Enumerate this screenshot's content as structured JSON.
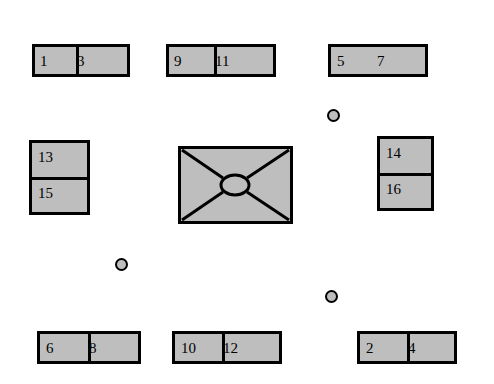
{
  "diagram": {
    "background_color": "#ffffff",
    "node_fill_color": "#bebebe",
    "node_border_color": "#000000",
    "nodes": [
      {
        "id": "node-top-left",
        "x": 32,
        "y": 44,
        "w": 98,
        "h": 33,
        "split": "vertical",
        "split_at": 44,
        "labels": [
          "1",
          "3"
        ]
      },
      {
        "id": "node-top-center",
        "x": 166,
        "y": 44,
        "w": 110,
        "h": 33,
        "split": "vertical",
        "split_at": 48,
        "labels": [
          "9",
          "11"
        ]
      },
      {
        "id": "node-top-right",
        "x": 328,
        "y": 44,
        "w": 100,
        "h": 33,
        "split": "none",
        "labels": [
          "5",
          "7"
        ]
      },
      {
        "id": "node-left-middle",
        "x": 29,
        "y": 140,
        "w": 61,
        "h": 75,
        "split": "horizontal",
        "split_at": 37,
        "labels": [
          "13",
          "15"
        ]
      },
      {
        "id": "node-right-middle",
        "x": 377,
        "y": 136,
        "w": 57,
        "h": 75,
        "split": "horizontal",
        "split_at": 37,
        "labels": [
          "14",
          "16"
        ]
      },
      {
        "id": "node-bottom-left",
        "x": 37,
        "y": 331,
        "w": 104,
        "h": 33,
        "split": "vertical",
        "split_at": 51,
        "labels": [
          "6",
          "8"
        ]
      },
      {
        "id": "node-bottom-center",
        "x": 172,
        "y": 331,
        "w": 110,
        "h": 33,
        "split": "vertical",
        "split_at": 50,
        "labels": [
          "10",
          "12"
        ]
      },
      {
        "id": "node-bottom-right",
        "x": 357,
        "y": 331,
        "w": 100,
        "h": 33,
        "split": "vertical",
        "split_at": 50,
        "labels": [
          "2",
          "4"
        ]
      }
    ],
    "hub": {
      "id": "node-center-hub",
      "x": 178,
      "y": 146,
      "w": 115,
      "h": 78,
      "ellipse": {
        "cx": 57,
        "cy": 39,
        "rx": 14,
        "ry": 10
      },
      "diagonal_count": 4
    },
    "dots": [
      {
        "id": "dot-upper-right",
        "x": 327,
        "y": 109,
        "d": 13
      },
      {
        "id": "dot-lower-left",
        "x": 115,
        "y": 258,
        "d": 13
      },
      {
        "id": "dot-lower-right",
        "x": 325,
        "y": 290,
        "d": 13
      }
    ]
  }
}
